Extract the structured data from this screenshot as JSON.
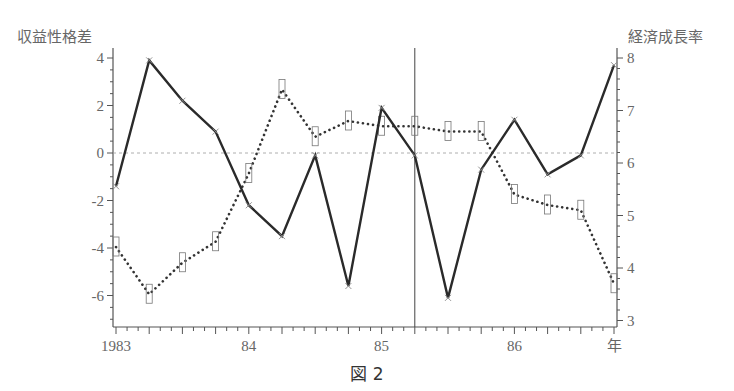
{
  "figure": {
    "caption": "図 2",
    "left_axis_title": "収益性格差",
    "right_axis_title": "経済成長率"
  },
  "chart_data": {
    "type": "line",
    "title": "",
    "caption": "図 2",
    "xlabel": "年",
    "ylabel_left": "収益性格差",
    "ylabel_right": "経済成長率",
    "x_tick_labels": [
      "1983",
      "84",
      "85",
      "86",
      "年"
    ],
    "x": [
      "1983Q1",
      "1983Q2",
      "1983Q3",
      "1983Q4",
      "1984Q1",
      "1984Q2",
      "1984Q3",
      "1984Q4",
      "1985Q1",
      "1985Q2",
      "1985Q3",
      "1985Q4",
      "1986Q1",
      "1986Q2",
      "1986Q3",
      "1986Q4"
    ],
    "ylim_left": [
      -7.3,
      4.2
    ],
    "left_ticks": [
      "4",
      "2",
      "0",
      "-2",
      "-4",
      "-6"
    ],
    "ylim_right": [
      2.9,
      8.2
    ],
    "right_ticks": [
      "8",
      "7",
      "6",
      "5",
      "4",
      "3"
    ],
    "grid": false,
    "zero_reference_line": "dashed horizontal at left-axis 0",
    "vertical_marker": "1985Q2",
    "series": [
      {
        "name": "収益性格差",
        "axis": "left",
        "style": "solid, x markers",
        "values": [
          -1.4,
          3.9,
          2.2,
          0.9,
          -2.2,
          -3.5,
          -0.1,
          -5.6,
          1.9,
          -0.1,
          -6.1,
          -0.7,
          1.4,
          -0.9,
          -0.1,
          3.7
        ]
      },
      {
        "name": "経済成長率",
        "axis": "right",
        "style": "dotted, rectangle markers",
        "values": [
          4.4,
          3.5,
          4.1,
          4.5,
          5.8,
          7.4,
          6.5,
          6.8,
          6.7,
          6.7,
          6.6,
          6.6,
          5.4,
          5.2,
          5.1,
          3.7
        ]
      }
    ]
  }
}
